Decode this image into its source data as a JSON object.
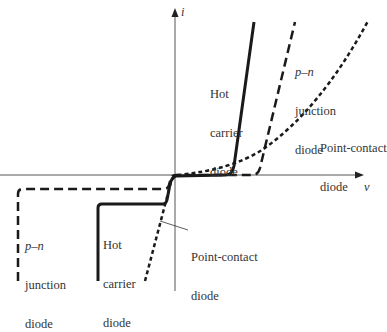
{
  "diagram": {
    "title": "",
    "type": "diode I-V characteristics",
    "axes": {
      "x_label": "v",
      "y_label": "i"
    },
    "curves": [
      {
        "name": "Hot carrier diode",
        "style": "solid"
      },
      {
        "name": "p–n junction diode",
        "style": "long-dash"
      },
      {
        "name": "Point-contact diode",
        "style": "short-dash"
      }
    ],
    "labels": {
      "hot_carrier_top": [
        "Hot",
        "carrier",
        "diode"
      ],
      "pn_top": [
        "p–n",
        "junction",
        "diode"
      ],
      "point_contact_top": [
        "Point-contact",
        "diode"
      ],
      "pn_bottom": [
        "p–n",
        "junction",
        "diode"
      ],
      "hot_carrier_bottom": [
        "Hot",
        "carrier",
        "diode"
      ],
      "point_contact_bottom": [
        "Point-contact",
        "diode"
      ]
    },
    "colors": {
      "line": "#1a1a1a",
      "axis": "#555555",
      "text": "#333333"
    }
  }
}
